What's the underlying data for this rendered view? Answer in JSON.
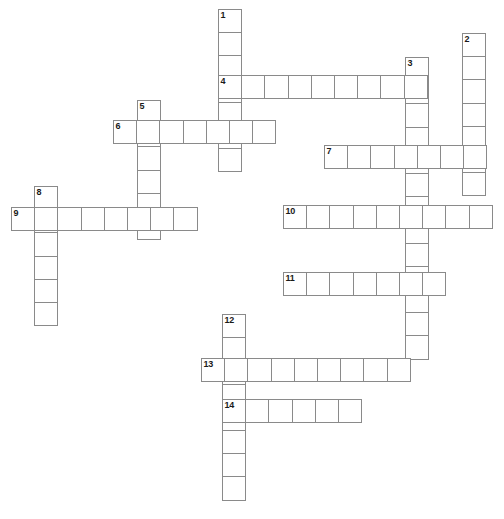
{
  "puzzle": {
    "kind": "crossword-grid",
    "title": "",
    "cell_size_px": 24.2,
    "grid_width_px": 504,
    "grid_height_px": 519,
    "colors": {
      "cell_fill": "#ffffff",
      "cell_border": "#8a8a8a",
      "number_text": "#1a1a1a",
      "background": "#ffffff"
    },
    "entry_count": 14,
    "across_count": 7,
    "down_count": 7,
    "entries": [
      {
        "number": "1",
        "direction": "down",
        "length": 7,
        "x": 218,
        "y": 9,
        "letters": ""
      },
      {
        "number": "2",
        "direction": "down",
        "length": 7,
        "x": 462,
        "y": 33,
        "letters": ""
      },
      {
        "number": "3",
        "direction": "down",
        "length": 13,
        "x": 405,
        "y": 57,
        "letters": ""
      },
      {
        "number": "4",
        "direction": "across",
        "length": 9,
        "x": 218,
        "y": 75,
        "letters": ""
      },
      {
        "number": "5",
        "direction": "down",
        "length": 6,
        "x": 137,
        "y": 100,
        "letters": ""
      },
      {
        "number": "6",
        "direction": "across",
        "length": 7,
        "x": 113,
        "y": 120,
        "letters": ""
      },
      {
        "number": "7",
        "direction": "across",
        "length": 7,
        "x": 324,
        "y": 145,
        "letters": ""
      },
      {
        "number": "8",
        "direction": "down",
        "length": 6,
        "x": 34,
        "y": 186,
        "letters": ""
      },
      {
        "number": "9",
        "direction": "across",
        "length": 8,
        "x": 11,
        "y": 207,
        "letters": ""
      },
      {
        "number": "10",
        "direction": "across",
        "length": 9,
        "x": 283,
        "y": 205,
        "letters": ""
      },
      {
        "number": "11",
        "direction": "across",
        "length": 7,
        "x": 283,
        "y": 272,
        "letters": ""
      },
      {
        "number": "12",
        "direction": "down",
        "length": 8,
        "x": 222,
        "y": 314,
        "letters": ""
      },
      {
        "number": "13",
        "direction": "across",
        "length": 9,
        "x": 201,
        "y": 358,
        "letters": ""
      },
      {
        "number": "14",
        "direction": "across",
        "length": 6,
        "x": 222,
        "y": 399,
        "letters": ""
      }
    ]
  }
}
